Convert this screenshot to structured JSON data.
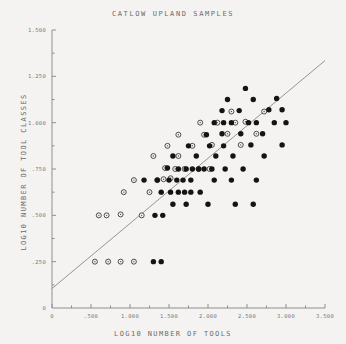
{
  "chart_data": {
    "type": "scatter",
    "title": "CATLOW UPLAND SAMPLES",
    "xlabel": "LOG10 NUMBER OF TOOLS",
    "ylabel": "LOG10 NUMBER OF TOOL CLASSES",
    "xlim": [
      0,
      3.5
    ],
    "ylim": [
      0,
      1.5
    ],
    "xticks": [
      0,
      0.5,
      1.0,
      1.5,
      2.0,
      2.5,
      3.0,
      3.5
    ],
    "xticklabels": [
      "0",
      ".500",
      "1.000",
      "1.500",
      "2.000",
      "2.500",
      "3.000",
      "3.500"
    ],
    "xminorticks": [
      0.25,
      0.75,
      1.25,
      1.75,
      2.25,
      2.75,
      3.25
    ],
    "yticks": [
      0.25,
      0.5,
      0.75,
      1.0,
      1.25,
      1.5
    ],
    "yticklabels": [
      ".250",
      ".500",
      ".750",
      "1.000",
      "1.250",
      "1.500"
    ],
    "yminorticks": [
      0.125,
      0.375,
      0.625,
      0.875,
      1.125,
      1.375
    ],
    "grid": false,
    "legend": null,
    "marker_styles": {
      "filled": "filled-circle",
      "open": "open-circle"
    },
    "trendline": {
      "label": "regression-line",
      "x0": 0.0,
      "y0": 0.105,
      "x1": 3.5,
      "y1": 1.335,
      "color": "#8a8a8a"
    },
    "series": [
      {
        "name": "open",
        "marker": "open-circle",
        "points": [
          [
            0.55,
            0.25
          ],
          [
            0.72,
            0.25
          ],
          [
            0.88,
            0.25
          ],
          [
            1.05,
            0.25
          ],
          [
            0.6,
            0.5
          ],
          [
            0.7,
            0.5
          ],
          [
            0.88,
            0.505
          ],
          [
            1.15,
            0.5
          ],
          [
            0.92,
            0.625
          ],
          [
            1.25,
            0.625
          ],
          [
            1.05,
            0.69
          ],
          [
            1.35,
            0.69
          ],
          [
            1.43,
            0.695
          ],
          [
            1.52,
            0.7
          ],
          [
            1.58,
            0.75
          ],
          [
            1.7,
            0.75
          ],
          [
            1.88,
            0.75
          ],
          [
            2.02,
            0.75
          ],
          [
            1.45,
            0.755
          ],
          [
            1.3,
            0.82
          ],
          [
            1.62,
            0.82
          ],
          [
            1.48,
            0.875
          ],
          [
            1.8,
            0.875
          ],
          [
            1.62,
            0.935
          ],
          [
            1.95,
            0.935
          ],
          [
            1.9,
            1.0
          ],
          [
            2.12,
            1.0
          ],
          [
            2.35,
            1.0
          ],
          [
            2.48,
            1.005
          ],
          [
            2.25,
            0.94
          ],
          [
            2.62,
            0.94
          ],
          [
            2.05,
            0.88
          ],
          [
            2.42,
            0.88
          ],
          [
            2.72,
            1.06
          ],
          [
            2.3,
            1.06
          ]
        ]
      },
      {
        "name": "filled",
        "marker": "filled-circle",
        "points": [
          [
            1.3,
            0.25
          ],
          [
            1.4,
            0.25
          ],
          [
            1.32,
            0.5
          ],
          [
            1.42,
            0.5
          ],
          [
            1.52,
            0.625
          ],
          [
            1.62,
            0.625
          ],
          [
            1.7,
            0.625
          ],
          [
            1.78,
            0.625
          ],
          [
            1.4,
            0.625
          ],
          [
            1.18,
            0.69
          ],
          [
            1.35,
            0.69
          ],
          [
            1.5,
            0.69
          ],
          [
            1.6,
            0.69
          ],
          [
            1.68,
            0.69
          ],
          [
            1.78,
            0.69
          ],
          [
            2.08,
            0.69
          ],
          [
            2.3,
            0.69
          ],
          [
            2.62,
            0.69
          ],
          [
            1.62,
            0.75
          ],
          [
            1.72,
            0.75
          ],
          [
            1.8,
            0.75
          ],
          [
            1.88,
            0.75
          ],
          [
            1.95,
            0.75
          ],
          [
            2.05,
            0.75
          ],
          [
            2.22,
            0.75
          ],
          [
            2.45,
            0.75
          ],
          [
            1.48,
            0.755
          ],
          [
            1.55,
            0.82
          ],
          [
            1.85,
            0.82
          ],
          [
            2.1,
            0.82
          ],
          [
            2.32,
            0.82
          ],
          [
            1.75,
            0.875
          ],
          [
            2.02,
            0.875
          ],
          [
            2.2,
            0.875
          ],
          [
            2.55,
            0.88
          ],
          [
            1.98,
            0.935
          ],
          [
            2.18,
            0.94
          ],
          [
            2.42,
            0.94
          ],
          [
            2.7,
            0.94
          ],
          [
            2.08,
            1.0
          ],
          [
            2.2,
            1.0
          ],
          [
            2.3,
            1.0
          ],
          [
            2.52,
            1.0
          ],
          [
            2.62,
            1.0
          ],
          [
            2.85,
            1.0
          ],
          [
            3.0,
            1.0
          ],
          [
            2.18,
            1.065
          ],
          [
            2.4,
            1.065
          ],
          [
            2.78,
            1.07
          ],
          [
            2.95,
            1.07
          ],
          [
            2.25,
            1.125
          ],
          [
            2.58,
            1.125
          ],
          [
            2.48,
            1.185
          ],
          [
            2.88,
            1.13
          ],
          [
            1.9,
            0.625
          ],
          [
            2.0,
            0.56
          ],
          [
            1.55,
            0.56
          ],
          [
            1.72,
            0.56
          ],
          [
            2.35,
            0.56
          ],
          [
            2.58,
            0.56
          ],
          [
            2.72,
            0.82
          ],
          [
            2.95,
            0.88
          ]
        ]
      }
    ]
  }
}
